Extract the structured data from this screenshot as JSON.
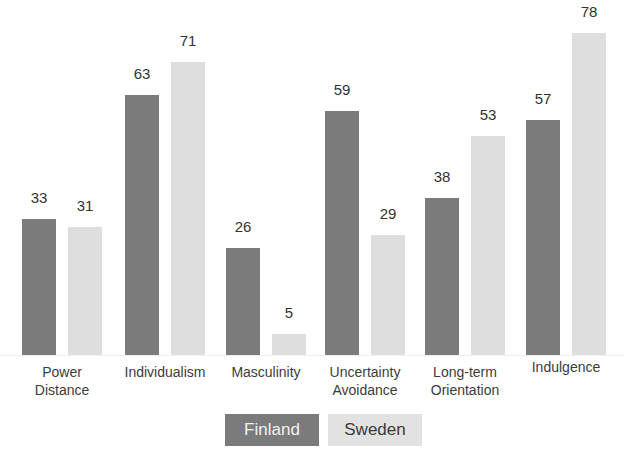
{
  "chart_data": {
    "type": "bar",
    "title": "",
    "xlabel": "",
    "ylabel": "",
    "ylim": [
      0,
      80
    ],
    "grid": false,
    "legend_position": "bottom",
    "categories": [
      "Power Distance",
      "Individualism",
      "Masculinity",
      "Uncertainty Avoidance",
      "Long-term Orientation",
      "Indulgence"
    ],
    "category_lines": [
      [
        "Power",
        "Distance"
      ],
      [
        "Individualism",
        ""
      ],
      [
        "Masculinity",
        ""
      ],
      [
        "Uncertainty",
        "Avoidance"
      ],
      [
        "Long-term",
        "Orientation"
      ],
      [
        "Indulgence",
        ""
      ]
    ],
    "series": [
      {
        "name": "Finland",
        "color": "#7b7b7b",
        "values": [
          33,
          63,
          26,
          59,
          38,
          57
        ]
      },
      {
        "name": "Sweden",
        "color": "#dedede",
        "values": [
          31,
          71,
          5,
          29,
          53,
          78
        ]
      }
    ]
  },
  "legend": {
    "finland": "Finland",
    "sweden": "Sweden"
  }
}
